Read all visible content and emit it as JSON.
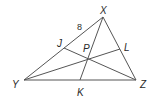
{
  "diagram": {
    "type": "triangle-with-cevians",
    "colors": {
      "line": "#555555",
      "text": "#2a2a2a",
      "background": "#ffffff"
    },
    "points": {
      "X": {
        "label": "X",
        "x": 103,
        "y": 17
      },
      "Y": {
        "label": "Y",
        "x": 24,
        "y": 80
      },
      "Z": {
        "label": "Z",
        "x": 136,
        "y": 80
      },
      "J": {
        "label": "J",
        "x": 64,
        "y": 48
      },
      "L": {
        "label": "L",
        "x": 120,
        "y": 49
      },
      "K": {
        "label": "K",
        "x": 80,
        "y": 80
      },
      "P": {
        "label": "P",
        "x": 89,
        "y": 59
      }
    },
    "segments": [
      {
        "from": "X",
        "to": "Y"
      },
      {
        "from": "Y",
        "to": "Z"
      },
      {
        "from": "Z",
        "to": "X"
      },
      {
        "from": "X",
        "to": "K"
      },
      {
        "from": "Y",
        "to": "L"
      },
      {
        "from": "Z",
        "to": "J"
      }
    ],
    "measurements": [
      {
        "segment": "XJ",
        "value": "8"
      }
    ]
  }
}
